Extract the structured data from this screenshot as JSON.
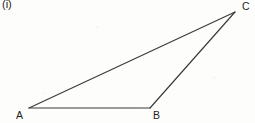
{
  "figure": {
    "part_label": "(i)",
    "shape_name": "triangle-abc",
    "stroke_color": "#3a3a3a",
    "label_color": "#1d1d1d",
    "background_color": "#fdfdfc",
    "vertices": [
      {
        "name": "A",
        "label": "A",
        "x": 29,
        "y": 108
      },
      {
        "name": "B",
        "label": "B",
        "x": 150,
        "y": 108
      },
      {
        "name": "C",
        "label": "C",
        "x": 235,
        "y": 12
      }
    ],
    "edges": [
      {
        "name": "edge-ab",
        "from": "A",
        "to": "B"
      },
      {
        "name": "edge-bc",
        "from": "B",
        "to": "C"
      },
      {
        "name": "edge-ca",
        "from": "C",
        "to": "A"
      }
    ]
  }
}
